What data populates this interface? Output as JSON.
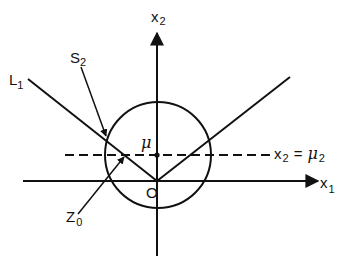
{
  "figure": {
    "type": "geometric diagram",
    "axes": {
      "horizontal": {
        "label": "x",
        "subscript": "1"
      },
      "vertical": {
        "label": "x",
        "subscript": "2"
      }
    },
    "origin_label": "O",
    "mean_label": "μ",
    "dashed_line_label": {
      "lhs": "x",
      "lhs_sub": "2",
      "eq": "=",
      "rhs": "μ",
      "rhs_sub": "2"
    },
    "line_label": {
      "text": "L",
      "subscript": "1"
    },
    "surface_label": {
      "text": "S",
      "subscript": "2"
    },
    "point_label": {
      "text": "Z",
      "subscript": "0"
    },
    "colors": {
      "ink": "#111111",
      "background": "#ffffff"
    }
  }
}
